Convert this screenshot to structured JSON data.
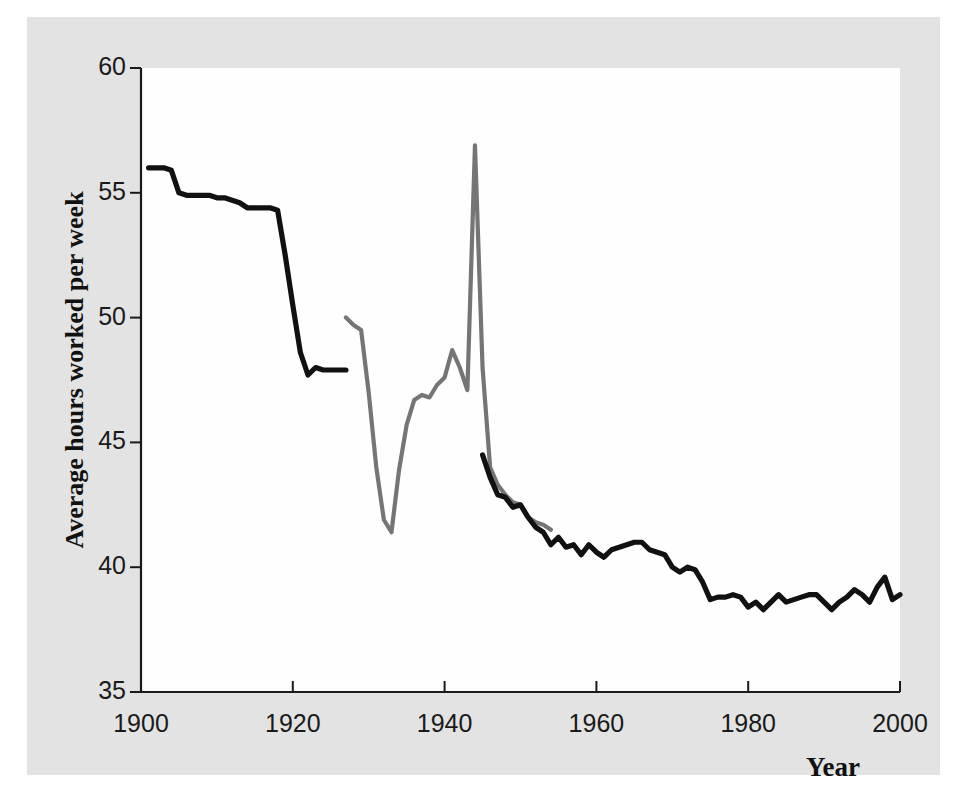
{
  "chart_data": {
    "type": "line",
    "title": "",
    "xlabel": "Year",
    "ylabel": "Average hours worked per week",
    "xlim": [
      1900,
      2000
    ],
    "ylim": [
      35,
      60
    ],
    "xticks": [
      1900,
      1920,
      1940,
      1960,
      1980,
      2000
    ],
    "yticks": [
      35,
      40,
      45,
      50,
      55,
      60
    ],
    "grid": false,
    "legend_position": "none",
    "series": [
      {
        "name": "black-series-early",
        "color": "#111111",
        "x": [
          1901,
          1903,
          1904,
          1905,
          1906,
          1907,
          1908,
          1909,
          1910,
          1911,
          1912,
          1913,
          1914,
          1915,
          1916,
          1917,
          1918,
          1919,
          1920,
          1921,
          1922,
          1923,
          1924,
          1925,
          1926,
          1927
        ],
        "values": [
          56.0,
          56.0,
          55.9,
          55.0,
          54.9,
          54.9,
          54.9,
          54.9,
          54.8,
          54.8,
          54.7,
          54.6,
          54.4,
          54.4,
          54.4,
          54.4,
          54.3,
          52.5,
          50.5,
          48.6,
          47.7,
          48.0,
          47.9,
          47.9,
          47.9,
          47.9
        ]
      },
      {
        "name": "gray-series-middle",
        "color": "#757575",
        "x": [
          1927,
          1928,
          1929,
          1930,
          1931,
          1932,
          1933,
          1934,
          1935,
          1936,
          1937,
          1938,
          1939,
          1940,
          1941,
          1942,
          1943,
          1944,
          1945,
          1946,
          1947,
          1948,
          1949,
          1950,
          1951,
          1952,
          1953,
          1954
        ],
        "values": [
          50.0,
          49.7,
          49.5,
          47.0,
          44.0,
          41.9,
          41.4,
          43.9,
          45.7,
          46.7,
          46.9,
          46.8,
          47.3,
          47.6,
          48.7,
          48.0,
          47.1,
          56.9,
          48.0,
          44.0,
          43.3,
          42.9,
          42.6,
          42.5,
          42.0,
          41.8,
          41.7,
          41.5
        ]
      },
      {
        "name": "black-series-late",
        "color": "#111111",
        "x": [
          1945,
          1946,
          1947,
          1948,
          1949,
          1950,
          1951,
          1952,
          1953,
          1954,
          1955,
          1956,
          1957,
          1958,
          1959,
          1960,
          1961,
          1962,
          1963,
          1964,
          1965,
          1966,
          1967,
          1968,
          1969,
          1970,
          1971,
          1972,
          1973,
          1974,
          1975,
          1976,
          1977,
          1978,
          1979,
          1980,
          1981,
          1982,
          1983,
          1984,
          1985,
          1986,
          1987,
          1988,
          1989,
          1990,
          1991,
          1992,
          1993,
          1994,
          1995,
          1996,
          1997,
          1998,
          1999,
          2000
        ],
        "values": [
          44.5,
          43.6,
          42.9,
          42.8,
          42.4,
          42.5,
          42.0,
          41.6,
          41.4,
          40.9,
          41.2,
          40.8,
          40.9,
          40.5,
          40.9,
          40.6,
          40.4,
          40.7,
          40.8,
          40.9,
          41.0,
          41.0,
          40.7,
          40.6,
          40.5,
          40.0,
          39.8,
          40.0,
          39.9,
          39.4,
          38.7,
          38.8,
          38.8,
          38.9,
          38.8,
          38.4,
          38.6,
          38.3,
          38.6,
          38.9,
          38.6,
          38.7,
          38.8,
          38.9,
          38.9,
          38.6,
          38.3,
          38.6,
          38.8,
          39.1,
          38.9,
          38.6,
          39.2,
          39.6,
          38.7,
          38.9
        ]
      }
    ]
  },
  "axes": {
    "y_title": "Average hours worked per week",
    "x_title": "Year",
    "y_tick_labels": [
      "60",
      "55",
      "50",
      "45",
      "40",
      "35"
    ],
    "x_tick_labels": [
      "1900",
      "1920",
      "1940",
      "1960",
      "1980",
      "2000"
    ]
  },
  "colors": {
    "page_background": "#e3e3e3",
    "plot_background": "#fefefe",
    "axis": "#1a1a1a",
    "series_black": "#111111",
    "series_gray": "#757575"
  }
}
